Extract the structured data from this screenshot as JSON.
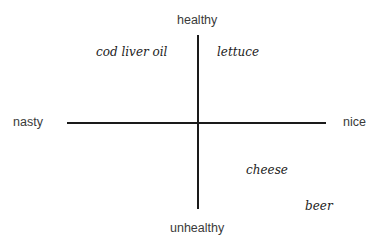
{
  "diagram": {
    "axes": {
      "top": "healthy",
      "bottom": "unhealthy",
      "left": "nasty",
      "right": "nice"
    },
    "items": [
      {
        "label": "cod liver oil",
        "quadrant": "nasty-healthy"
      },
      {
        "label": "lettuce",
        "quadrant": "nice-healthy"
      },
      {
        "label": "cheese",
        "quadrant": "nice-unhealthy"
      },
      {
        "label": "beer",
        "quadrant": "nice-unhealthy"
      }
    ]
  }
}
